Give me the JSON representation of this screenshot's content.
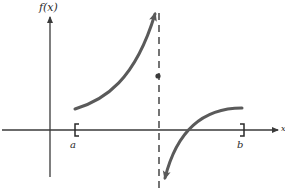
{
  "diagram": {
    "type": "function-graph",
    "y_axis_label": "f(x)",
    "x_axis_label": "x",
    "interval": {
      "left_label": "a",
      "right_label": "b",
      "left_bracket": "[",
      "right_bracket": "]"
    },
    "features": {
      "vertical_asymptote": "dashed vertical line between a and b",
      "isolated_point": "filled dot on the asymptote",
      "left_branch": "increasing curve rising toward +infinity approaching asymptote from left",
      "right_branch": "curve coming from -infinity on right of asymptote, increasing and leveling off near b"
    },
    "colors": {
      "axes": "#3a3a3a",
      "curve": "#5a5a5a",
      "asymptote": "#2a2a2a",
      "background": "#ffffff"
    }
  }
}
